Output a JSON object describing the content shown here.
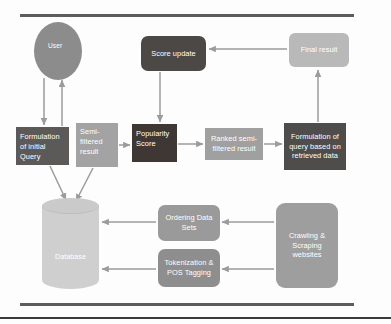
{
  "diagram": {
    "title_rules": [
      "top-rule",
      "bottom-rule",
      "page-rule"
    ],
    "nodes": {
      "user": "User",
      "formulation_initial_query": "Formulation of initial Query",
      "semi_filtered_result": "Semi-filtered result",
      "popularity_score": "Popularity Score",
      "ranked_semi_filtered_result": "Ranked semi-filtered result",
      "formulation_query_retrieved": "Formulation of query based on retrieved data",
      "score_update": "Score update",
      "final_result": "Final result",
      "database": "Database",
      "ordering_data_sets": "Ordering Data Sets",
      "tokenization_pos_tagging": "Tokenization & POS Tagging",
      "crawling_scraping_websites": "Crawling & Scraping websites"
    },
    "colors": {
      "dark_brown": "#3f3733",
      "dark_gray": "#5c5a58",
      "mid_gray": "#9e9e9e",
      "light_gray": "#cfcfcf",
      "connector": "#9b9b9b",
      "rule": "#5d5d5d"
    }
  }
}
